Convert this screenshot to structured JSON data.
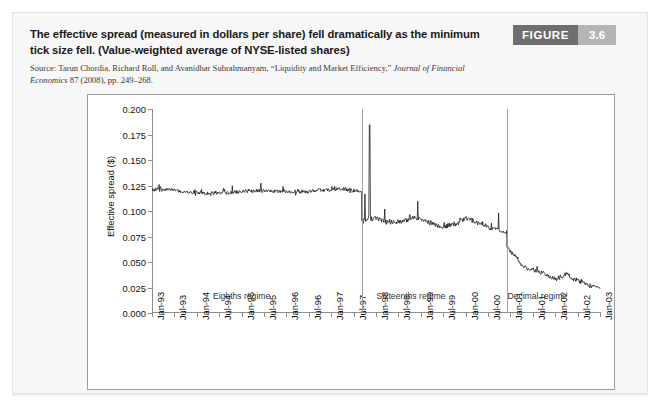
{
  "figure": {
    "badge_label": "FIGURE",
    "badge_number": "3.6",
    "title": "The effective spread (measured in dollars per share) fell dramatically as the minimum tick size fell. (Value-weighted average of NYSE-listed shares)",
    "source_prefix": "Source: Tarun Chordia, Richard Roll, and Avanidhar Subrahmanyam, “Liquidity and Market Efficiency,” ",
    "source_italic_1": "Journal of Financial Economics",
    "source_suffix": " 87 (2008), pp. 249–268."
  },
  "chart_data": {
    "type": "line",
    "title": "",
    "xlabel": "",
    "ylabel": "Effective spread ($)",
    "ylim": [
      0.0,
      0.2
    ],
    "y_ticks": [
      0.0,
      0.025,
      0.05,
      0.075,
      0.1,
      0.125,
      0.15,
      0.175,
      0.2
    ],
    "y_tick_labels": [
      "0.000",
      "0.025",
      "0.050",
      "0.075",
      "0.100",
      "0.125",
      "0.150",
      "0.175",
      "0.200"
    ],
    "grid": false,
    "legend": "none",
    "x_tick_labels": [
      "Jan-93",
      "Jul-93",
      "Jan-94",
      "Jul-94",
      "Jan-95",
      "Jul-95",
      "Jan-96",
      "Jul-96",
      "Jan-97",
      "Jul-97",
      "Jan-98",
      "Jul-98",
      "Jan-99",
      "Jul-99",
      "Jan-00",
      "Jul-00",
      "Jan-01",
      "Jul-01",
      "Jan-02",
      "Jul-02",
      "Jan-03"
    ],
    "x_range_start": "Jan-93",
    "x_range_end": "Jan-03",
    "annotations": [
      {
        "text": "Eighths regime",
        "x_label": "Jan-95",
        "x_frac": 0.2,
        "y": 0.0155
      },
      {
        "text": "Sixteenths regime",
        "x_label": "Jul-98",
        "x_frac": 0.578,
        "y": 0.0155
      },
      {
        "text": "Decimal regime",
        "x_label": "Jul-01",
        "x_frac": 0.86,
        "y": 0.0155
      }
    ],
    "regime_dividers": [
      {
        "name": "eighths-to-sixteenths",
        "x_frac": 0.468
      },
      {
        "name": "sixteenths-to-decimal",
        "x_frac": 0.792
      }
    ],
    "series": [
      {
        "name": "Effective spread",
        "color": "#111111",
        "description": "Weekly value-weighted average effective spread of NYSE-listed shares, Jan-1993 through Jan-2003.",
        "segments": [
          {
            "regime": "Eighths regime",
            "x_frac_start": 0.0,
            "x_frac_end": 0.468,
            "baseline_start": 0.1215,
            "baseline_end": 0.1195,
            "baseline_path": [
              0.1215,
              0.1205,
              0.1185,
              0.1175,
              0.118,
              0.1195,
              0.12,
              0.1185,
              0.119,
              0.1205,
              0.1215,
              0.1195
            ],
            "noise_amplitude": 0.0035,
            "spike_amplitude": 0.009
          },
          {
            "regime": "Sixteenths regime",
            "x_frac_start": 0.468,
            "x_frac_end": 0.792,
            "baseline_start": 0.0905,
            "baseline_end": 0.0795,
            "baseline_path": [
              0.0905,
              0.0925,
              0.089,
              0.09,
              0.093,
              0.0895,
              0.0845,
              0.087,
              0.093,
              0.088,
              0.082,
              0.0795
            ],
            "noise_amplitude": 0.0045,
            "spike_amplitude": 0.035
          },
          {
            "regime": "Decimal regime",
            "x_frac_start": 0.792,
            "x_frac_end": 1.0,
            "baseline_start": 0.064,
            "baseline_end": 0.0245,
            "baseline_path": [
              0.064,
              0.0555,
              0.045,
              0.042,
              0.04,
              0.0355,
              0.033,
              0.038,
              0.033,
              0.029,
              0.026,
              0.0245
            ],
            "noise_amplitude": 0.004,
            "spike_amplitude": 0.012
          }
        ],
        "key_levels": {
          "eighths_average": 0.119,
          "sixteenths_average": 0.089,
          "decimal_average": 0.04,
          "max_value": 0.185,
          "max_value_location": "early sixteenths regime",
          "final_value": 0.024
        }
      }
    ]
  }
}
